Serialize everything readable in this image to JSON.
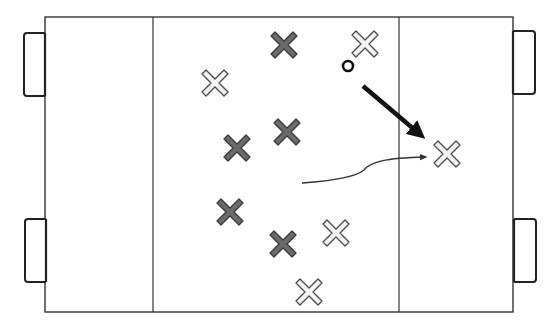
{
  "diagram": {
    "colors": {
      "background": "#ffffff",
      "line": "#333333",
      "team_dark_fill": "#6b6b6b",
      "team_dark_stroke": "#3a3a3a",
      "team_light_fill": "#f3f3f3",
      "team_light_stroke": "#4a4a4a",
      "ball": "#111111",
      "pass_arrow": "#111111",
      "run_path": "#333333"
    },
    "field": {
      "x": 45,
      "y": 17,
      "width": 468,
      "height": 295,
      "left_zone_line_x": 153,
      "right_zone_line_x": 399
    },
    "goals": [
      {
        "id": "left-top-goal",
        "x": 24,
        "y": 33,
        "width": 21,
        "height": 63
      },
      {
        "id": "left-bottom-goal",
        "x": 25,
        "y": 219,
        "width": 21,
        "height": 63
      },
      {
        "id": "right-top-goal",
        "x": 513,
        "y": 31,
        "width": 22,
        "height": 63
      },
      {
        "id": "right-bottom-goal",
        "x": 514,
        "y": 219,
        "width": 22,
        "height": 63
      }
    ],
    "players_dark": [
      {
        "x": 284,
        "y": 45
      },
      {
        "x": 287,
        "y": 132
      },
      {
        "x": 237,
        "y": 148
      },
      {
        "x": 230,
        "y": 212
      },
      {
        "x": 283,
        "y": 244
      }
    ],
    "players_light": [
      {
        "x": 365,
        "y": 44
      },
      {
        "x": 215,
        "y": 83
      },
      {
        "x": 447,
        "y": 154
      },
      {
        "x": 336,
        "y": 233
      },
      {
        "x": 309,
        "y": 292
      }
    ],
    "ball": {
      "x": 348,
      "y": 66,
      "r": 5
    },
    "pass_arrow": {
      "x1": 363,
      "y1": 86,
      "x2": 422,
      "y2": 136
    },
    "run_path": {
      "d": "M302 183 C 330 181, 355 178, 364 170 C 370 162, 385 158, 425 157"
    }
  }
}
